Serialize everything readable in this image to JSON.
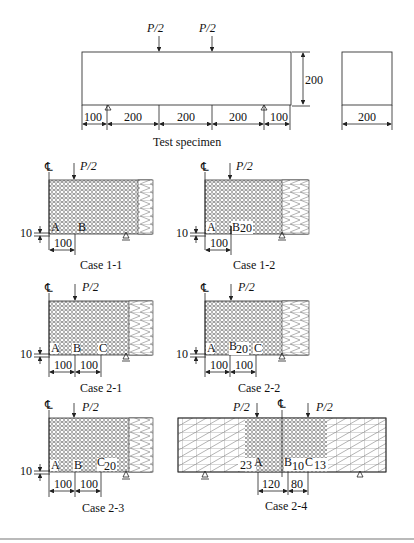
{
  "figure": {
    "specimen": {
      "loads": [
        "P/2",
        "P/2"
      ],
      "height_dim": "200",
      "span_dims": [
        "100",
        "200",
        "200",
        "200",
        "100"
      ],
      "section_width_dim": "200",
      "caption": "Test specimen"
    },
    "centerline_symbol": "℄",
    "load_label": "P/2",
    "cases": [
      {
        "id": "case-1-1",
        "caption": "Case 1-1",
        "points": [
          "A",
          "B"
        ],
        "dims": [
          "100"
        ],
        "offset": "10",
        "notch": ""
      },
      {
        "id": "case-1-2",
        "caption": "Case 1-2",
        "points": [
          "A",
          "B"
        ],
        "dims": [
          "100"
        ],
        "offset": "10",
        "notch": "20"
      },
      {
        "id": "case-2-1",
        "caption": "Case 2-1",
        "points": [
          "A",
          "B",
          "C"
        ],
        "dims": [
          "100",
          "100"
        ],
        "offset": "10",
        "notch": ""
      },
      {
        "id": "case-2-2",
        "caption": "Case 2-2",
        "points": [
          "A",
          "B",
          "C"
        ],
        "dims": [
          "100",
          "100"
        ],
        "offset": "10",
        "notch": "20"
      },
      {
        "id": "case-2-3",
        "caption": "Case 2-3",
        "points": [
          "A",
          "B",
          "C"
        ],
        "dims": [
          "100",
          "100"
        ],
        "offset": "10",
        "notch": "20"
      },
      {
        "id": "case-2-4",
        "caption": "Case 2-4",
        "points": [
          "A",
          "B",
          "C"
        ],
        "dims": [
          "120",
          "80"
        ],
        "notches": [
          "23",
          "10",
          "13"
        ]
      }
    ]
  }
}
